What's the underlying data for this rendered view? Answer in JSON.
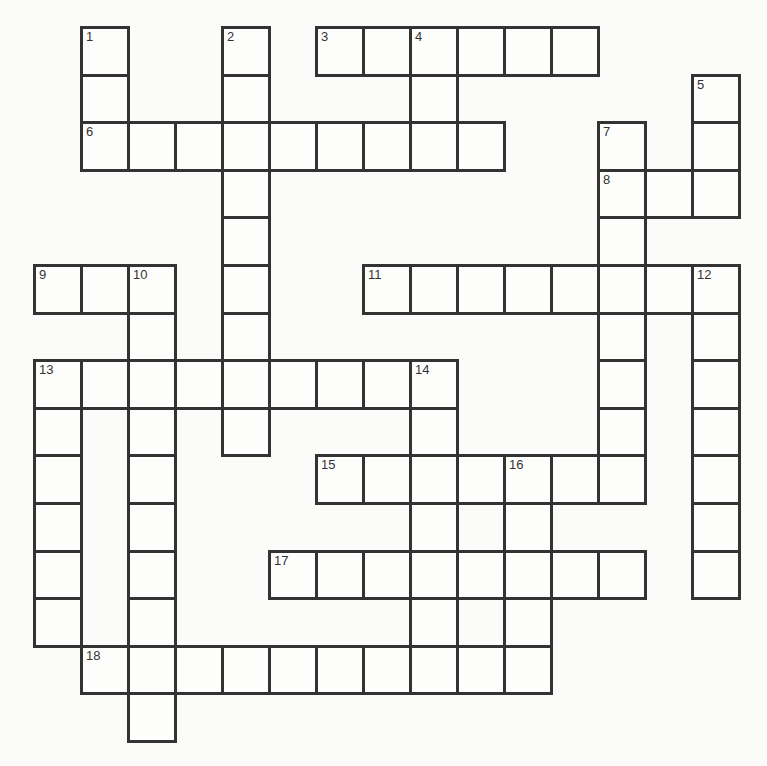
{
  "puzzle": {
    "type": "crossword",
    "cols": 15,
    "rows": 15,
    "cells": [
      [
        0,
        1,
        "1"
      ],
      [
        0,
        4,
        "2"
      ],
      [
        0,
        6,
        "3"
      ],
      [
        0,
        7,
        ""
      ],
      [
        0,
        8,
        "4"
      ],
      [
        0,
        9,
        ""
      ],
      [
        0,
        10,
        ""
      ],
      [
        0,
        11,
        ""
      ],
      [
        1,
        1,
        ""
      ],
      [
        1,
        4,
        ""
      ],
      [
        1,
        8,
        ""
      ],
      [
        1,
        14,
        "5"
      ],
      [
        2,
        1,
        "6"
      ],
      [
        2,
        2,
        ""
      ],
      [
        2,
        3,
        ""
      ],
      [
        2,
        4,
        ""
      ],
      [
        2,
        5,
        ""
      ],
      [
        2,
        6,
        ""
      ],
      [
        2,
        7,
        ""
      ],
      [
        2,
        8,
        ""
      ],
      [
        2,
        9,
        ""
      ],
      [
        2,
        12,
        "7"
      ],
      [
        2,
        14,
        ""
      ],
      [
        3,
        4,
        ""
      ],
      [
        3,
        12,
        "8"
      ],
      [
        3,
        13,
        ""
      ],
      [
        3,
        14,
        ""
      ],
      [
        4,
        4,
        ""
      ],
      [
        4,
        12,
        ""
      ],
      [
        5,
        0,
        "9"
      ],
      [
        5,
        1,
        ""
      ],
      [
        5,
        2,
        "10"
      ],
      [
        5,
        4,
        ""
      ],
      [
        5,
        7,
        "11"
      ],
      [
        5,
        8,
        ""
      ],
      [
        5,
        9,
        ""
      ],
      [
        5,
        10,
        ""
      ],
      [
        5,
        11,
        ""
      ],
      [
        5,
        12,
        ""
      ],
      [
        5,
        13,
        ""
      ],
      [
        5,
        14,
        "12"
      ],
      [
        6,
        2,
        ""
      ],
      [
        6,
        4,
        ""
      ],
      [
        6,
        12,
        ""
      ],
      [
        6,
        14,
        ""
      ],
      [
        7,
        0,
        "13"
      ],
      [
        7,
        1,
        ""
      ],
      [
        7,
        2,
        ""
      ],
      [
        7,
        3,
        ""
      ],
      [
        7,
        4,
        ""
      ],
      [
        7,
        5,
        ""
      ],
      [
        7,
        6,
        ""
      ],
      [
        7,
        7,
        ""
      ],
      [
        7,
        8,
        "14"
      ],
      [
        7,
        12,
        ""
      ],
      [
        7,
        14,
        ""
      ],
      [
        8,
        0,
        ""
      ],
      [
        8,
        2,
        ""
      ],
      [
        8,
        4,
        ""
      ],
      [
        8,
        8,
        ""
      ],
      [
        8,
        12,
        ""
      ],
      [
        8,
        14,
        ""
      ],
      [
        9,
        0,
        ""
      ],
      [
        9,
        2,
        ""
      ],
      [
        9,
        6,
        "15"
      ],
      [
        9,
        7,
        ""
      ],
      [
        9,
        8,
        ""
      ],
      [
        9,
        9,
        ""
      ],
      [
        9,
        10,
        "16"
      ],
      [
        9,
        11,
        ""
      ],
      [
        9,
        12,
        ""
      ],
      [
        9,
        14,
        ""
      ],
      [
        10,
        0,
        ""
      ],
      [
        10,
        2,
        ""
      ],
      [
        10,
        8,
        ""
      ],
      [
        10,
        10,
        ""
      ],
      [
        10,
        14,
        ""
      ],
      [
        11,
        0,
        ""
      ],
      [
        11,
        2,
        ""
      ],
      [
        11,
        5,
        "17"
      ],
      [
        11,
        6,
        ""
      ],
      [
        11,
        7,
        ""
      ],
      [
        11,
        8,
        ""
      ],
      [
        11,
        9,
        ""
      ],
      [
        11,
        10,
        ""
      ],
      [
        11,
        11,
        ""
      ],
      [
        11,
        12,
        ""
      ],
      [
        11,
        14,
        ""
      ],
      [
        12,
        0,
        ""
      ],
      [
        12,
        2,
        ""
      ],
      [
        12,
        8,
        ""
      ],
      [
        12,
        10,
        ""
      ],
      [
        13,
        1,
        "18"
      ],
      [
        13,
        2,
        ""
      ],
      [
        13,
        3,
        ""
      ],
      [
        13,
        4,
        ""
      ],
      [
        13,
        5,
        ""
      ],
      [
        13,
        6,
        ""
      ],
      [
        13,
        7,
        ""
      ],
      [
        13,
        8,
        ""
      ],
      [
        13,
        9,
        ""
      ],
      [
        13,
        10,
        ""
      ],
      [
        14,
        2,
        ""
      ]
    ],
    "across_numbers": [
      "3",
      "6",
      "8",
      "9",
      "11",
      "13",
      "15",
      "17",
      "18"
    ],
    "down_numbers": [
      "1",
      "2",
      "4",
      "5",
      "7",
      "10",
      "12",
      "13",
      "14",
      "16"
    ]
  }
}
